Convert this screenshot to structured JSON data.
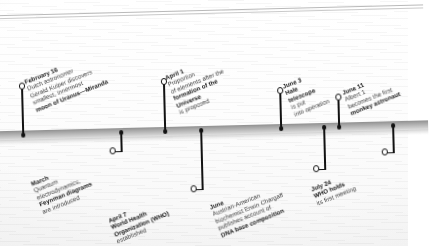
{
  "page": {
    "kind": "timeline-infographic",
    "year_context": "1948",
    "background_color": "#ffffff",
    "bar_color": "#a5a5a5",
    "marker_color": "#121212"
  },
  "timeline": {
    "bar_label": "timeline-axis",
    "events_above": [
      {
        "id": "feb-16-miranda",
        "date": "February 16",
        "lines": [
          {
            "text": "February 16",
            "style": "bold"
          },
          {
            "text": "Dutch astronomer",
            "style": "regular"
          },
          {
            "text": "Gerald Kuiper discovers",
            "style": "regular"
          },
          {
            "text": "smallest, innermost",
            "style": "regular"
          },
          {
            "text": "moon of Uranus—Miranda",
            "style": "bold"
          }
        ]
      },
      {
        "id": "apr-1-universe",
        "date": "April 1",
        "lines": [
          {
            "text": "April 1",
            "style": "bold"
          },
          {
            "text": "Proportion",
            "style": "regular"
          },
          {
            "text": "of elements after the",
            "style": "regular"
          },
          {
            "text": "formation of the",
            "style": "bold"
          },
          {
            "text": "Universe",
            "style": "bold"
          },
          {
            "text": "is proposed",
            "style": "regular"
          }
        ]
      },
      {
        "id": "jun-3-hale",
        "date": "June 3",
        "lines": [
          {
            "text": "June 3",
            "style": "bold"
          },
          {
            "text": "Hale",
            "style": "bold"
          },
          {
            "text": "telescope",
            "style": "bold"
          },
          {
            "text": "is put",
            "style": "regular"
          },
          {
            "text": "into operation",
            "style": "regular"
          }
        ]
      },
      {
        "id": "jun-11-albert",
        "date": "June 11",
        "lines": [
          {
            "text": "June 11",
            "style": "bold"
          },
          {
            "text": "Albert 1",
            "style": "regular"
          },
          {
            "text": "becomes the first",
            "style": "regular"
          },
          {
            "text": "monkey astronaut",
            "style": "bold"
          }
        ]
      }
    ],
    "events_below": [
      {
        "id": "march-feynman",
        "date": "March",
        "lines": [
          {
            "text": "March",
            "style": "bold"
          },
          {
            "text": "Quantum",
            "style": "regular"
          },
          {
            "text": "electrodynamics,",
            "style": "regular"
          },
          {
            "text": "Feynman diagrams",
            "style": "bold"
          },
          {
            "text": "are introduced",
            "style": "regular"
          }
        ]
      },
      {
        "id": "apr-7-who",
        "date": "April 7",
        "lines": [
          {
            "text": "April 7",
            "style": "bold"
          },
          {
            "text": "World  Health",
            "style": "bold"
          },
          {
            "text": "Organization (WHO)",
            "style": "bold"
          },
          {
            "text": "established",
            "style": "regular"
          }
        ]
      },
      {
        "id": "jun-chargaff-dna",
        "date": "June",
        "lines": [
          {
            "text": "June",
            "style": "bold"
          },
          {
            "text": "Austrian-American",
            "style": "regular"
          },
          {
            "text": "biochemist Erwin Chargaff",
            "style": "regular"
          },
          {
            "text": "publishes account of",
            "style": "regular"
          },
          {
            "text": "DNA base composition",
            "style": "bold"
          }
        ]
      },
      {
        "id": "jul-24-who-meeting",
        "date": "July 24",
        "lines": [
          {
            "text": "July 24",
            "style": "bold"
          },
          {
            "text": "WHO holds",
            "style": "bold"
          },
          {
            "text": "its first meeting",
            "style": "regular"
          }
        ]
      }
    ]
  }
}
